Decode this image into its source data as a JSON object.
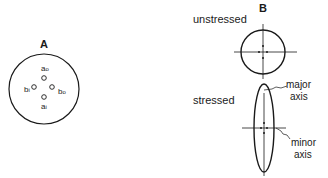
{
  "panel_a": {
    "label": "A",
    "points": [
      {
        "name": "a",
        "sub": "o"
      },
      {
        "name": "b",
        "sub": "i"
      },
      {
        "name": "b",
        "sub": "o"
      },
      {
        "name": "a",
        "sub": "i"
      }
    ]
  },
  "panel_b": {
    "label": "B",
    "unstressed_label": "unstressed",
    "stressed_label": "stressed",
    "major_axis_label_1": "major",
    "major_axis_label_2": "axis",
    "minor_axis_label_1": "minor",
    "minor_axis_label_2": "axis"
  },
  "colors": {
    "ink": "#1a1a1a",
    "background": "#ffffff"
  }
}
